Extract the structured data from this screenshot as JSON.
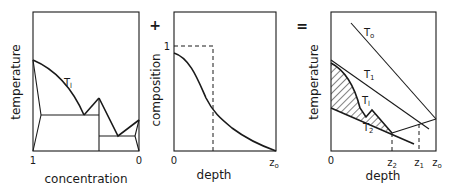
{
  "operators": {
    "plus": "+",
    "equals": "="
  },
  "panels": [
    {
      "id": "phase-diagram",
      "ylabel": "temperature",
      "xlabel": "concentration",
      "x_ticks": [
        "1",
        "0"
      ],
      "curve_labels": {
        "liquidus": "T",
        "liquidus_sub": "l"
      }
    },
    {
      "id": "composition-profile",
      "ylabel": "composition",
      "xlabel": "depth",
      "y_ticks": [
        "1"
      ],
      "x_ticks": {
        "start": "0",
        "end": "z",
        "end_sub": "o"
      }
    },
    {
      "id": "temperature-depth",
      "ylabel": "temperature",
      "xlabel": "depth",
      "x_ticks": {
        "start": "0",
        "z2": "z",
        "z2_sub": "2",
        "z1": "z",
        "z1_sub": "1",
        "z0": "z",
        "z0_sub": "o"
      },
      "curve_labels": {
        "T0": "T",
        "T0_sub": "o",
        "T1": "T",
        "T1_sub": "1",
        "Tl": "T",
        "Tl_sub": "l",
        "T2": "T",
        "T2_sub": "2"
      }
    }
  ],
  "colors": {
    "ink": "#1a1a1a",
    "background": "#ffffff"
  }
}
